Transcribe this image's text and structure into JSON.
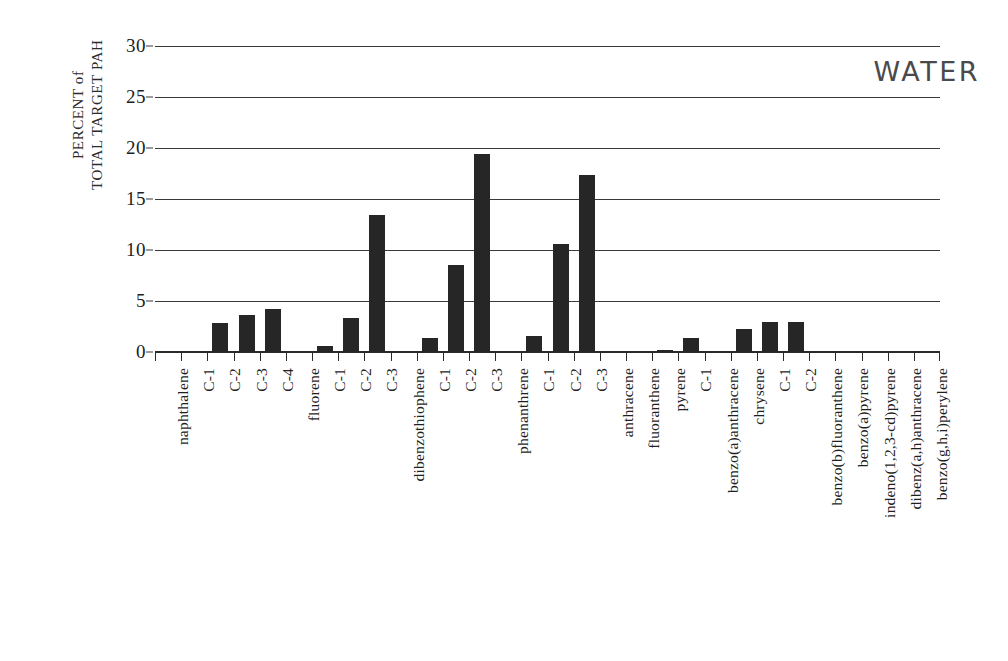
{
  "chart_data": {
    "type": "bar",
    "title": "",
    "annotation": "WATER",
    "xlabel": "",
    "ylabel": "PERCENT of\nTOTAL TARGET PAH",
    "ylabel_lines": [
      "PERCENT of",
      "TOTAL TARGET PAH"
    ],
    "ylim": [
      0,
      30
    ],
    "yticks": [
      0,
      5,
      10,
      15,
      20,
      25,
      30
    ],
    "ytick_labels": [
      "0",
      "5",
      "10",
      "15",
      "20",
      "25",
      "30"
    ],
    "grid": true,
    "grid_axis": "y",
    "legend": "none",
    "bar_color": "#262626",
    "categories": [
      "naphthalene",
      "C-1",
      "C-2",
      "C-3",
      "C-4",
      "fluorene",
      "C-1",
      "C-2",
      "C-3",
      "dibenzothiophene",
      "C-1",
      "C-2",
      "C-3",
      "phenanthrene",
      "C-1",
      "C-2",
      "C-3",
      "anthracene",
      "fluoranthene",
      "pyrene",
      "C-1",
      "benzo(a)anthracene",
      "chrysene",
      "C-1",
      "C-2",
      "benzo(b)fluoranthene",
      "benzo(a)pyrene",
      "indeno(1,2,3-cd)pyrene",
      "dibenz(a,h)anthracene",
      "benzo(g,h,i)perylene"
    ],
    "values": [
      0,
      0,
      2.8,
      3.6,
      4.2,
      0,
      0.6,
      3.3,
      13.4,
      0,
      1.4,
      8.5,
      19.4,
      0,
      1.6,
      10.6,
      17.4,
      0,
      0,
      0.2,
      1.4,
      0,
      2.3,
      2.9,
      2.9,
      0,
      0,
      0,
      0,
      0
    ]
  },
  "axis": {
    "ylabel_line1": "PERCENT of",
    "ylabel_line2": "TOTAL TARGET PAH"
  }
}
